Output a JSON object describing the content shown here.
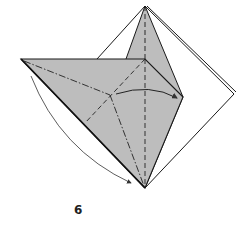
{
  "diagram": {
    "type": "origami-step",
    "step_number": "6",
    "colors": {
      "paper_colored": "#bdbdbd",
      "paper_white": "#ffffff",
      "line": "#1a1a1a",
      "arrow": "#333333"
    },
    "elements": [
      "back square (white side)",
      "tall upright gray flap",
      "front gray triangle with valley and mountain fold lines",
      "curved arrow: fold left point down to bottom",
      "curved arrow: fold center point toward right"
    ]
  }
}
